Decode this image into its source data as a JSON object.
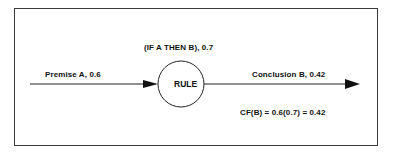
{
  "diagram": {
    "premise_label": "Premise A, 0.6",
    "rule_condition_label": "(IF A THEN B), 0.7",
    "rule_node_label": "RULE",
    "conclusion_label": "Conclusion B, 0.42",
    "formula_label": "CF(B) = 0.6(0.7) = 0.42",
    "colors": {
      "line": "#222222",
      "border": "#3a3a3a",
      "background": "#ffffff"
    }
  }
}
